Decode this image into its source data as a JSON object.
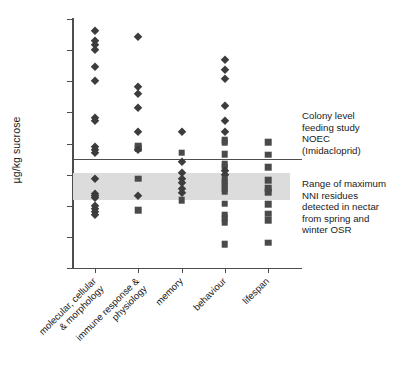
{
  "chart_data": {
    "type": "scatter",
    "title": "",
    "xlabel": "",
    "ylabel": "µg/kg sucrose",
    "yscale": "log",
    "ylim": [
      0.01,
      1000000
    ],
    "ytick_labels": [
      "1000000",
      "100000",
      "10000",
      "1000",
      "100",
      "10",
      "1",
      "0.1",
      "0.01"
    ],
    "ytick_values": [
      1000000,
      100000,
      10000,
      1000,
      100,
      10,
      1,
      0.1,
      0.01
    ],
    "grid": false,
    "legend_position": "right-annotations",
    "categories": [
      "molecular, cellular & morphology",
      "immune response & physiology",
      "memory",
      "behaviour",
      "lifespan"
    ],
    "category_label_lines": [
      [
        "molecular, cellular",
        "& morphology"
      ],
      [
        "immune response &",
        "physiology"
      ],
      [
        "memory"
      ],
      [
        "behaviour"
      ],
      [
        "lifespan"
      ]
    ],
    "marker_types": [
      {
        "name": "diamond",
        "shape": "diamond",
        "color": "#3c3c3c"
      },
      {
        "name": "square",
        "shape": "square",
        "color": "#4a4a4a"
      }
    ],
    "series": [
      {
        "name": "molecular, cellular & morphology",
        "category_index": 0,
        "points": [
          {
            "value": 420000,
            "marker": "diamond"
          },
          {
            "value": 190000,
            "marker": "diamond"
          },
          {
            "value": 150000,
            "marker": "diamond"
          },
          {
            "value": 98000,
            "marker": "diamond"
          },
          {
            "value": 29000,
            "marker": "diamond"
          },
          {
            "value": 10000,
            "marker": "diamond"
          },
          {
            "value": 640,
            "marker": "diamond"
          },
          {
            "value": 520,
            "marker": "diamond"
          },
          {
            "value": 80,
            "marker": "diamond"
          },
          {
            "value": 60,
            "marker": "diamond"
          },
          {
            "value": 51,
            "marker": "diamond"
          },
          {
            "value": 7.2,
            "marker": "diamond"
          },
          {
            "value": 2.4,
            "marker": "diamond"
          },
          {
            "value": 2.0,
            "marker": "diamond"
          },
          {
            "value": 1.8,
            "marker": "diamond"
          },
          {
            "value": 1.0,
            "marker": "diamond"
          },
          {
            "value": 0.8,
            "marker": "diamond"
          },
          {
            "value": 0.62,
            "marker": "diamond"
          },
          {
            "value": 0.5,
            "marker": "diamond"
          }
        ]
      },
      {
        "name": "immune response & physiology",
        "category_index": 1,
        "points": [
          {
            "value": 260000,
            "marker": "diamond"
          },
          {
            "value": 6400,
            "marker": "diamond"
          },
          {
            "value": 3800,
            "marker": "diamond"
          },
          {
            "value": 1400,
            "marker": "diamond"
          },
          {
            "value": 230,
            "marker": "diamond"
          },
          {
            "value": 85,
            "marker": "square"
          },
          {
            "value": 72,
            "marker": "square"
          },
          {
            "value": 62,
            "marker": "diamond"
          },
          {
            "value": 7.4,
            "marker": "square"
          },
          {
            "value": 2.1,
            "marker": "diamond"
          },
          {
            "value": 0.72,
            "marker": "square"
          }
        ]
      },
      {
        "name": "memory",
        "category_index": 2,
        "points": [
          {
            "value": 240,
            "marker": "diamond"
          },
          {
            "value": 51,
            "marker": "square"
          },
          {
            "value": 26,
            "marker": "diamond"
          },
          {
            "value": 11,
            "marker": "diamond"
          },
          {
            "value": 7.5,
            "marker": "diamond"
          },
          {
            "value": 5.2,
            "marker": "diamond"
          },
          {
            "value": 3.4,
            "marker": "diamond"
          },
          {
            "value": 2.6,
            "marker": "diamond"
          },
          {
            "value": 1.5,
            "marker": "square"
          }
        ]
      },
      {
        "name": "behaviour",
        "category_index": 3,
        "points": [
          {
            "value": 48000,
            "marker": "diamond"
          },
          {
            "value": 23000,
            "marker": "diamond"
          },
          {
            "value": 12000,
            "marker": "diamond"
          },
          {
            "value": 1550,
            "marker": "diamond"
          },
          {
            "value": 540,
            "marker": "diamond"
          },
          {
            "value": 240,
            "marker": "diamond"
          },
          {
            "value": 130,
            "marker": "square"
          },
          {
            "value": 110,
            "marker": "square"
          },
          {
            "value": 46,
            "marker": "square"
          },
          {
            "value": 22,
            "marker": "square"
          },
          {
            "value": 18,
            "marker": "square"
          },
          {
            "value": 13,
            "marker": "diamond"
          },
          {
            "value": 9.5,
            "marker": "diamond"
          },
          {
            "value": 7.5,
            "marker": "square"
          },
          {
            "value": 6.0,
            "marker": "square"
          },
          {
            "value": 4.6,
            "marker": "square"
          },
          {
            "value": 3.6,
            "marker": "square"
          },
          {
            "value": 2.8,
            "marker": "square"
          },
          {
            "value": 1.15,
            "marker": "square"
          },
          {
            "value": 0.52,
            "marker": "square"
          },
          {
            "value": 0.4,
            "marker": "square"
          },
          {
            "value": 0.3,
            "marker": "square"
          },
          {
            "value": 0.058,
            "marker": "square"
          }
        ]
      },
      {
        "name": "lifespan",
        "category_index": 4,
        "points": [
          {
            "value": 110,
            "marker": "square"
          },
          {
            "value": 44,
            "marker": "square"
          },
          {
            "value": 17,
            "marker": "square"
          },
          {
            "value": 6.6,
            "marker": "square"
          },
          {
            "value": 3.6,
            "marker": "square"
          },
          {
            "value": 2.7,
            "marker": "square"
          },
          {
            "value": 1.1,
            "marker": "square"
          },
          {
            "value": 0.55,
            "marker": "square"
          },
          {
            "value": 0.35,
            "marker": "square"
          },
          {
            "value": 0.065,
            "marker": "square"
          }
        ]
      }
    ],
    "reference_line": {
      "name": "Colony level feeding study NOEC (Imidacloprid)",
      "value": 31,
      "color": "#4d4d4d"
    },
    "reference_band": {
      "name": "Range of maximum NNI residues detected in nectar from spring and winter OSR",
      "low": 1.5,
      "high": 11,
      "color": "#dcdcdc"
    }
  },
  "annotations": {
    "noec": "Colony level\nfeeding study\nNOEC\n(Imidacloprid)",
    "band": "Range of maximum\nNNI residues\ndetected in nectar\nfrom spring and\nwinter OSR"
  },
  "axis": {
    "y_title": "µg/kg sucrose"
  }
}
